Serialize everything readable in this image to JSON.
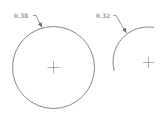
{
  "drawing": {
    "stroke_color": "#7a7a7a",
    "circles": [
      {
        "label": "R.38",
        "center": [
          53,
          67
        ],
        "radius": 41,
        "full": true
      },
      {
        "label": "R.32",
        "center": [
          148,
          62
        ],
        "radius": 35,
        "full": false
      }
    ]
  }
}
